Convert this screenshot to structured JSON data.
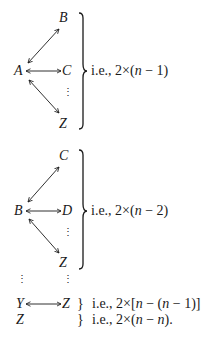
{
  "group1": {
    "source": "A",
    "targets": [
      "B",
      "C",
      "Z"
    ],
    "dots": "⋮",
    "note_prefix": "i.e., 2×(",
    "note_var": "n",
    "note_suffix": " − 1)"
  },
  "group2": {
    "source": "B",
    "targets": [
      "C",
      "D",
      "Z"
    ],
    "dots": "⋮",
    "note_prefix": "i.e., 2×(",
    "note_var": "n",
    "note_suffix": " − 2)"
  },
  "continuation": {
    "left_dots": "⋮",
    "right_dots": "⋮"
  },
  "row_y": {
    "source": "Y",
    "target": "Z",
    "brace": "}",
    "note_prefix": "i.e., 2×[",
    "note_var1": "n",
    "note_mid": " − (",
    "note_var2": "n",
    "note_suffix": " − 1)]"
  },
  "row_z": {
    "source": "Z",
    "brace": "}",
    "note_prefix": "i.e., 2×(",
    "note_var1": "n",
    "note_mid": " − ",
    "note_var2": "n",
    "note_suffix": ")."
  }
}
